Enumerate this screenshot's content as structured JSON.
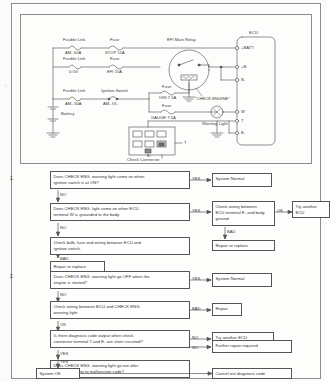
{
  "document": {
    "type": "automotive-service-manual-page",
    "diagram_title": "EFI Check Engine Warning Light Circuit"
  },
  "wiring_diagram": {
    "ecu_label": "ECU",
    "ecu_terminals": [
      "+BATT",
      "+B",
      "B₁",
      "W",
      "T",
      "E₁"
    ],
    "components": [
      {
        "name": "fusible-link-am1",
        "type_label": "Fusible Link",
        "value_label": "AM₁ 60A"
      },
      {
        "name": "fuse-stop",
        "type_label": "Fuse",
        "value_label": "STOP 15A"
      },
      {
        "name": "fusible-link-05g",
        "type_label": "Fusible Link",
        "value_label": "0.5G"
      },
      {
        "name": "fuse-efi",
        "type_label": "Fuse",
        "value_label": "EFI 15A"
      },
      {
        "name": "fusible-link-am2",
        "type_label": "Fusible Link",
        "value_label": "AM₂ 30A"
      },
      {
        "name": "ignition-switch",
        "type_label": "Ignition Switch",
        "value_label": "AM₂  IG₁"
      },
      {
        "name": "fuse-ign",
        "type_label": "Fuse",
        "value_label": "IGN 7.5A"
      },
      {
        "name": "fuse-gauge",
        "type_label": "Fuse",
        "value_label": "GAUGE 7.5A"
      }
    ],
    "relay_label": "EFI Main Relay",
    "check_engine_label": "\"CHECK ENGINE\"",
    "warning_light_label": "Warning Light",
    "battery_label": "Battery",
    "check_connector_label": "Check Connector",
    "connector_terminal_t": "T",
    "connector_terminal_e1": "E₁"
  },
  "flowchart": {
    "sections": [
      {
        "number": "1.",
        "steps": [
          {
            "id": "s1-q1",
            "text": [
              "Does CHECK ENG. warning light come on when",
              "ignition switch is at ON?"
            ],
            "branch_right_label": "YES",
            "branch_down_label": "NO"
          },
          {
            "id": "s1-r1",
            "text": [
              "System Normal"
            ]
          },
          {
            "id": "s1-q2",
            "text": [
              "Does CHECK ENG. light come on when ECU",
              "terminal W is grounded to the body."
            ],
            "branch_right_label": "YES",
            "branch_down_label": "NO"
          },
          {
            "id": "s1-r2",
            "text": [
              "Check wiring between",
              "ECU terminal E₁ and body",
              "ground."
            ],
            "branch_right_label": "OK",
            "branch_down_label": "BAD"
          },
          {
            "id": "s1-r3",
            "text": [
              "Try another",
              "ECU"
            ]
          },
          {
            "id": "s1-r4",
            "text": [
              "Repair or replace"
            ]
          },
          {
            "id": "s1-q3",
            "text": [
              "Check bulb, fuse and wiring between ECU and",
              "ignition switch."
            ],
            "branch_down_label": "BAD"
          },
          {
            "id": "s1-r5",
            "text": [
              "Repair or replace"
            ]
          }
        ]
      },
      {
        "number": "2.",
        "steps": [
          {
            "id": "s2-q1",
            "text": [
              "Does CHECK ENG. warning light go OFF when the",
              "engine is started?"
            ],
            "branch_right_label": "YES",
            "branch_down_label": "NO"
          },
          {
            "id": "s2-r1",
            "text": [
              "System Normal"
            ]
          },
          {
            "id": "s2-q2",
            "text": [
              "Check wiring between ECU and CHECK ENG.",
              "warning light."
            ],
            "branch_right_label": "BAD",
            "branch_down_label": "OK"
          },
          {
            "id": "s2-r2",
            "text": [
              "Repair"
            ]
          },
          {
            "id": "s2-q3",
            "text": [
              "Is there diagnosis code output when check",
              "connector terminal T and E₁ are short circuited?"
            ],
            "branch_right_label": "NO",
            "branch_down_label": "YES"
          },
          {
            "id": "s2-r3",
            "text": [
              "Try another ECU"
            ]
          },
          {
            "id": "s2-q4",
            "text": [
              "Does CHECK ENG. warning light go out after",
              "repair according to malfunction code?"
            ],
            "branch_right_label": "NO",
            "branch_down_label": "YES"
          },
          {
            "id": "s2-r4",
            "text": [
              "Further repair required"
            ]
          },
          {
            "id": "s2-r5",
            "text": [
              "System OK"
            ]
          },
          {
            "id": "s2-r6",
            "text": [
              "Cancel out diagnosis code"
            ]
          }
        ]
      }
    ]
  },
  "colors": {
    "ink": "#2f2f2f",
    "rule": "#555555",
    "frame": "#8d8d8d",
    "paper": "#fdfdfc"
  }
}
